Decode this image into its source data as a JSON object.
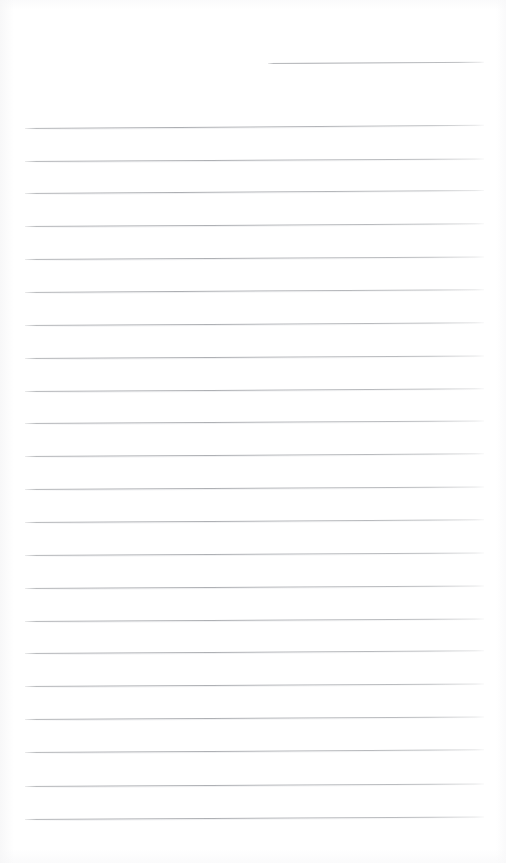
{
  "document": {
    "kind": "scanned-ruled-paper",
    "title": "Blank lined notebook page",
    "page_width": 506,
    "page_height": 863,
    "background_color": "#ffffff",
    "rule_color": "#b0b2b6",
    "rule_thickness_px": 1,
    "content_text": "",
    "margin_left_px": 25,
    "margin_right_px": 484,
    "line_spacing_px": 32.5,
    "total_rules": 23
  },
  "header_rule": {
    "name": "header-date-rule",
    "x_start": 268,
    "x_end": 484,
    "y": 63,
    "tilt_deg": -0.35,
    "label": ""
  },
  "body_rules": [
    {
      "y": 128,
      "x_start": 25,
      "x_end": 484,
      "tilt_deg": -0.4
    },
    {
      "y": 161,
      "x_start": 25,
      "x_end": 484,
      "tilt_deg": -0.32
    },
    {
      "y": 193,
      "x_start": 25,
      "x_end": 484,
      "tilt_deg": -0.36
    },
    {
      "y": 226,
      "x_start": 25,
      "x_end": 484,
      "tilt_deg": -0.34
    },
    {
      "y": 259,
      "x_start": 25,
      "x_end": 484,
      "tilt_deg": -0.3
    },
    {
      "y": 292,
      "x_start": 25,
      "x_end": 484,
      "tilt_deg": -0.35
    },
    {
      "y": 325,
      "x_start": 25,
      "x_end": 484,
      "tilt_deg": -0.33
    },
    {
      "y": 358,
      "x_start": 25,
      "x_end": 484,
      "tilt_deg": -0.31
    },
    {
      "y": 391,
      "x_start": 25,
      "x_end": 484,
      "tilt_deg": -0.34
    },
    {
      "y": 423,
      "x_start": 25,
      "x_end": 484,
      "tilt_deg": -0.3
    },
    {
      "y": 456,
      "x_start": 25,
      "x_end": 484,
      "tilt_deg": -0.33
    },
    {
      "y": 489,
      "x_start": 25,
      "x_end": 484,
      "tilt_deg": -0.31
    },
    {
      "y": 522,
      "x_start": 25,
      "x_end": 484,
      "tilt_deg": -0.34
    },
    {
      "y": 555,
      "x_start": 25,
      "x_end": 484,
      "tilt_deg": -0.3
    },
    {
      "y": 588,
      "x_start": 25,
      "x_end": 484,
      "tilt_deg": -0.32
    },
    {
      "y": 621,
      "x_start": 25,
      "x_end": 484,
      "tilt_deg": -0.3
    },
    {
      "y": 653,
      "x_start": 25,
      "x_end": 484,
      "tilt_deg": -0.33
    },
    {
      "y": 686,
      "x_start": 25,
      "x_end": 484,
      "tilt_deg": -0.31
    },
    {
      "y": 719,
      "x_start": 25,
      "x_end": 484,
      "tilt_deg": -0.3
    },
    {
      "y": 752,
      "x_start": 25,
      "x_end": 484,
      "tilt_deg": -0.33
    },
    {
      "y": 786,
      "x_start": 25,
      "x_end": 484,
      "tilt_deg": -0.31
    },
    {
      "y": 819,
      "x_start": 25,
      "x_end": 484,
      "tilt_deg": -0.3
    }
  ]
}
